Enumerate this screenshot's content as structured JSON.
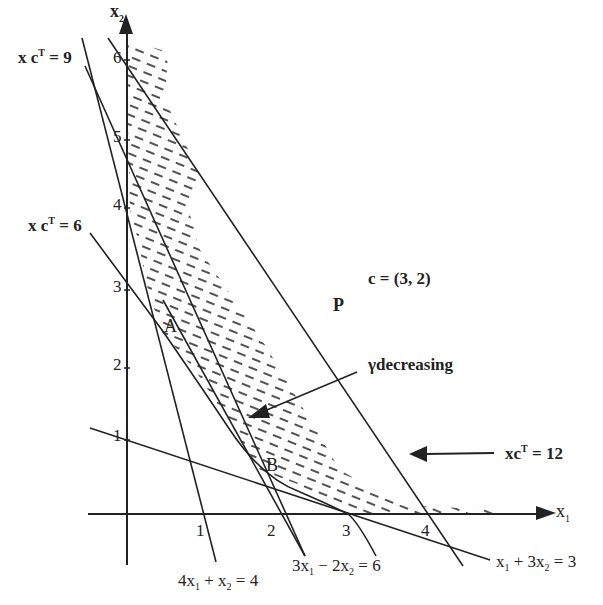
{
  "diagram": {
    "axes": {
      "x_label": "x",
      "x_label_sub": "1",
      "y_label": "x",
      "y_label_sub": "2",
      "x_ticks": [
        "1",
        "2",
        "3",
        "4"
      ],
      "y_ticks": [
        "1",
        "2",
        "3",
        "4",
        "5",
        "6"
      ]
    },
    "line_labels": {
      "xcT9": {
        "pre": "x c",
        "sup": "T",
        "post": " = 9"
      },
      "xcT6": {
        "pre": "x c",
        "sup": "T",
        "post": " = 6"
      },
      "xcT12": {
        "pre": "xc",
        "sup": "T",
        "post": " = 12"
      },
      "c4x1": {
        "a": "4x",
        "s1": "1",
        "b": " + x",
        "s2": "2",
        "c": " = 4"
      },
      "c3x1": {
        "a": "3x",
        "s1": "1",
        "b": " − 2x",
        "s2": "2",
        "c": " = 6"
      },
      "cx1": {
        "a": "x",
        "s1": "1",
        "b": " + 3x",
        "s2": "2",
        "c": " = 3"
      }
    },
    "annotations": {
      "c_vector": "c = (3, 2)",
      "P": "P",
      "A": "A",
      "B": "B",
      "gamma_decreasing": "γdecreasing"
    },
    "colors": {
      "ink": "#222222",
      "background": "#ffffff"
    }
  }
}
